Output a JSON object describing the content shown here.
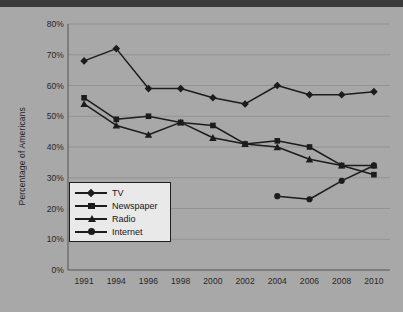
{
  "chart_data": {
    "type": "line",
    "title": "",
    "xlabel": "",
    "ylabel": "Percentage of Americans",
    "categories": [
      "1991",
      "1994",
      "1996",
      "1998",
      "2000",
      "2002",
      "2004",
      "2006",
      "2008",
      "2010"
    ],
    "ylim": [
      0,
      80
    ],
    "ytick_values": [
      0,
      10,
      20,
      30,
      40,
      50,
      60,
      70,
      80
    ],
    "ytick_labels": [
      "0%",
      "10%",
      "20%",
      "30%",
      "40%",
      "50%",
      "60%",
      "70%",
      "80%"
    ],
    "grid": true,
    "grid_axis": "y",
    "legend_position": "lower-left-inside",
    "series": [
      {
        "name": "TV",
        "marker": "diamond",
        "color": "#1c1c1c",
        "values": [
          68,
          72,
          59,
          59,
          56,
          54,
          60,
          57,
          57,
          58
        ]
      },
      {
        "name": "Newspaper",
        "marker": "square",
        "color": "#1c1c1c",
        "values": [
          56,
          49,
          50,
          48,
          47,
          41,
          42,
          40,
          34,
          31
        ]
      },
      {
        "name": "Radio",
        "marker": "triangle",
        "color": "#1c1c1c",
        "values": [
          54,
          47,
          44,
          48,
          43,
          41,
          40,
          36,
          34,
          34
        ]
      },
      {
        "name": "Internet",
        "marker": "circle",
        "color": "#1c1c1c",
        "values": [
          null,
          null,
          null,
          null,
          null,
          null,
          24,
          23,
          29,
          34
        ]
      }
    ]
  },
  "colors": {
    "page_background": "#a8a8a8",
    "plot_background": "#a8a8a8",
    "axis": "#555555",
    "gridline": "#8e8e8e",
    "line": "#1c1c1c",
    "text": "#262626",
    "legend_background": "#e9e9e9",
    "legend_border": "#1e1e1e",
    "top_band": "#3a3a3a"
  },
  "legend": {
    "items": [
      {
        "label": "TV",
        "marker": "diamond-marker"
      },
      {
        "label": "Newspaper",
        "marker": "square-marker"
      },
      {
        "label": "Radio",
        "marker": "triangle-marker"
      },
      {
        "label": "Internet",
        "marker": "circle-marker"
      }
    ]
  }
}
